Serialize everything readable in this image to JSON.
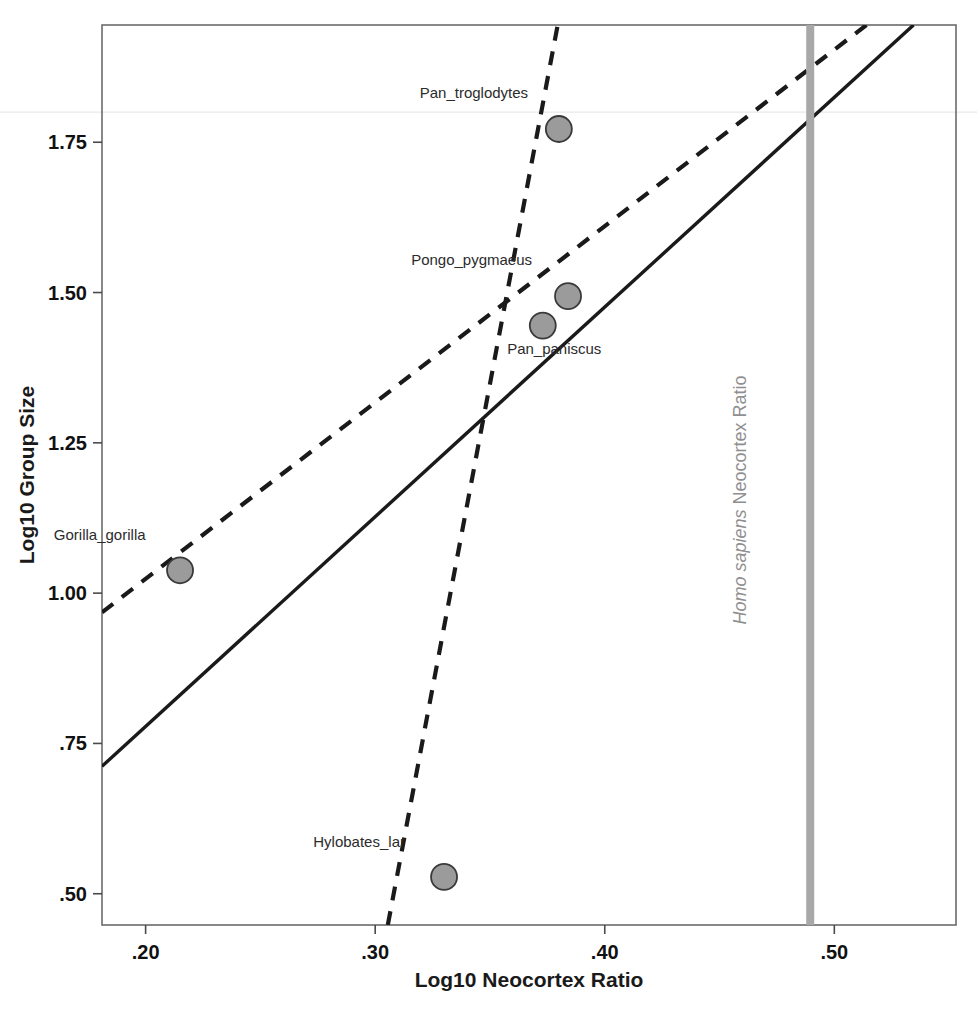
{
  "chart_data": {
    "type": "scatter",
    "title": "",
    "xlabel": "Log10 Neocortex Ratio",
    "ylabel": "Log10 Group Size",
    "xlim": [
      0.181,
      0.553
    ],
    "ylim": [
      0.448,
      1.945
    ],
    "xticks": [
      ".20",
      ".30",
      ".40",
      ".50"
    ],
    "xtick_values": [
      0.2,
      0.3,
      0.4,
      0.5
    ],
    "yticks": [
      "1.75",
      "1.50",
      "1.25",
      "1.00",
      ".75",
      ".50"
    ],
    "ytick_values": [
      1.75,
      1.5,
      1.25,
      1.0,
      0.75,
      0.5
    ],
    "grid": false,
    "legend": "none",
    "points": [
      {
        "label": "Pan_troglodytes",
        "x": 0.38,
        "y": 1.772,
        "label_dx": -0.037,
        "label_dy": 0.052
      },
      {
        "label": "Pongo_pygmaeus",
        "x": 0.384,
        "y": 1.494,
        "label_dx": -0.042,
        "label_dy": 0.052
      },
      {
        "label": "Pan_paniscus",
        "x": 0.373,
        "y": 1.445,
        "label_dx": 0.005,
        "label_dy": -0.048
      },
      {
        "label": "Gorilla_gorilla",
        "x": 0.215,
        "y": 1.038,
        "label_dx": -0.035,
        "label_dy": 0.05
      },
      {
        "label": "Hylobates_lar",
        "x": 0.33,
        "y": 0.528,
        "label_dx": -0.037,
        "label_dy": 0.05
      }
    ],
    "lines": [
      {
        "name": "solid-fit-line",
        "style": "solid",
        "color": "#1a1a1a",
        "x1": 0.181,
        "y1": 0.712,
        "x2": 0.5345,
        "y2": 1.945
      },
      {
        "name": "dashed-fit-line",
        "style": "dashed",
        "color": "#1a1a1a",
        "x1": 0.181,
        "y1": 0.968,
        "x2": 0.514,
        "y2": 1.945
      },
      {
        "name": "steep-dashed-line",
        "style": "dashed",
        "color": "#1a1a1a",
        "x1": 0.3055,
        "y1": 0.448,
        "x2": 0.3795,
        "y2": 1.945
      }
    ],
    "vertical_reference_line": {
      "label_prefix": "Homo sapiens",
      "label_suffix": " Neocortex Ratio",
      "x": 0.4895,
      "color": "#a8a8a8"
    },
    "faint_gridline_y": 1.8,
    "marker": {
      "fill": "#9b9b9b",
      "stroke": "#3a3a3a",
      "radius_px": 13
    }
  }
}
